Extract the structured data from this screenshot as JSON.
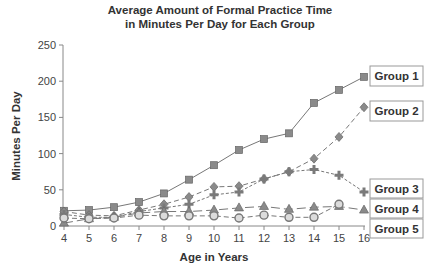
{
  "chart_data": {
    "type": "line",
    "title": "Average Amount of Formal Practice Time in Minutes Per Day for Each Group",
    "title_lines": [
      "Average Amount of Formal Practice Time",
      "in Minutes Per Day for Each Group"
    ],
    "xlabel": "Age in Years",
    "ylabel": "Minutes Per Day",
    "x": [
      4,
      5,
      6,
      7,
      8,
      9,
      10,
      11,
      12,
      13,
      14,
      15,
      16
    ],
    "ylim": [
      0,
      250
    ],
    "yticks": [
      0,
      50,
      100,
      150,
      200,
      250
    ],
    "grid": false,
    "legend_position": "right, inline labels at line ends",
    "series": [
      {
        "name": "Group 1",
        "marker": "square",
        "line": "solid",
        "values": [
          21,
          22,
          26,
          33,
          45,
          64,
          84,
          105,
          120,
          128,
          170,
          188,
          206
        ]
      },
      {
        "name": "Group 2",
        "marker": "diamond",
        "line": "dashed",
        "values": [
          20,
          15,
          14,
          22,
          30,
          40,
          54,
          55,
          65,
          75,
          93,
          123,
          164
        ]
      },
      {
        "name": "Group 3",
        "marker": "plus",
        "line": "dotted-dashed",
        "values": [
          16,
          12,
          12,
          20,
          25,
          30,
          43,
          47,
          65,
          75,
          78,
          70,
          47
        ]
      },
      {
        "name": "Group 4",
        "marker": "triangle",
        "line": "long-dashed",
        "values": [
          4,
          10,
          12,
          18,
          20,
          20,
          22,
          25,
          27,
          23,
          26,
          27,
          22
        ]
      },
      {
        "name": "Group 5",
        "marker": "circle",
        "line": "dashed",
        "values": [
          11,
          10,
          11,
          15,
          14,
          14,
          14,
          11,
          15,
          12,
          12,
          30,
          null
        ]
      }
    ]
  },
  "labels": {
    "title_line1": "Average Amount of Formal Practice Time",
    "title_line2": "in Minutes Per Day for Each Group",
    "xlabel": "Age in Years",
    "ylabel": "Minutes Per Day",
    "legend": [
      "Group 1",
      "Group 2",
      "Group 3",
      "Group 4",
      "Group 5"
    ]
  },
  "colors": {
    "marker_fill": "#8a8a8a",
    "line": "#777777",
    "axis": "#888888",
    "text": "#333333"
  }
}
